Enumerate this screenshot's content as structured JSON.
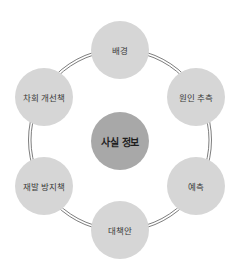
{
  "diagram": {
    "type": "cycle",
    "center": {
      "label": "사실 정보",
      "color": "#a8a8a8"
    },
    "nodes": [
      {
        "label": "배경",
        "position": "top"
      },
      {
        "label": "원인 추측",
        "position": "upper-right"
      },
      {
        "label": "예측",
        "position": "lower-right"
      },
      {
        "label": "대책안",
        "position": "bottom"
      },
      {
        "label": "재발 방지책",
        "position": "lower-left"
      },
      {
        "label": "차회 개선책",
        "position": "upper-left"
      }
    ],
    "node_color": "#d6d6d6",
    "ring_color": "#6e6e6e"
  }
}
